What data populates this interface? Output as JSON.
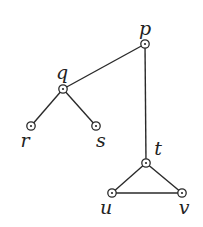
{
  "diagram": {
    "type": "graph",
    "nodes": [
      {
        "id": "p",
        "label": "p",
        "x": 145,
        "y": 44,
        "lx": 145,
        "ly": 35
      },
      {
        "id": "q",
        "label": "q",
        "x": 63,
        "y": 89,
        "lx": 62,
        "ly": 79
      },
      {
        "id": "r",
        "label": "r",
        "x": 31,
        "y": 126,
        "lx": 25,
        "ly": 147
      },
      {
        "id": "s",
        "label": "s",
        "x": 96,
        "y": 126,
        "lx": 101,
        "ly": 147
      },
      {
        "id": "t",
        "label": "t",
        "x": 146,
        "y": 163,
        "lx": 158,
        "ly": 155
      },
      {
        "id": "u",
        "label": "u",
        "x": 112,
        "y": 193,
        "lx": 106,
        "ly": 214
      },
      {
        "id": "v",
        "label": "v",
        "x": 182,
        "y": 193,
        "lx": 184,
        "ly": 214
      }
    ],
    "edges": [
      {
        "from": "p",
        "to": "q"
      },
      {
        "from": "p",
        "to": "t"
      },
      {
        "from": "q",
        "to": "r"
      },
      {
        "from": "q",
        "to": "s"
      },
      {
        "from": "t",
        "to": "u"
      },
      {
        "from": "t",
        "to": "v"
      },
      {
        "from": "u",
        "to": "v"
      }
    ]
  }
}
